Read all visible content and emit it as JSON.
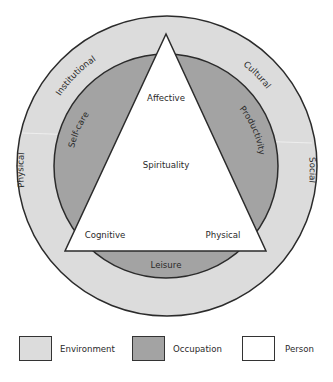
{
  "diagram": {
    "environment_labels": {
      "institutional": "Institutional",
      "cultural": "Cultural",
      "physical": "Physical",
      "social": "Social"
    },
    "occupation_labels": {
      "self_care": "Self-care",
      "productivity": "Productivity",
      "leisure": "Leisure"
    },
    "person_labels": {
      "affective": "Affective",
      "spirituality": "Spirituality",
      "cognitive": "Cognitive",
      "physical": "Physical"
    }
  },
  "legend": {
    "items": [
      {
        "label": "Environment",
        "color": "#dcdcdc"
      },
      {
        "label": "Occupation",
        "color": "#a3a3a3"
      },
      {
        "label": "Person",
        "color": "#ffffff"
      }
    ]
  },
  "colors": {
    "environment": "#dcdcdc",
    "occupation": "#a3a3a3",
    "person": "#ffffff",
    "stroke": "#2b2b2b"
  }
}
